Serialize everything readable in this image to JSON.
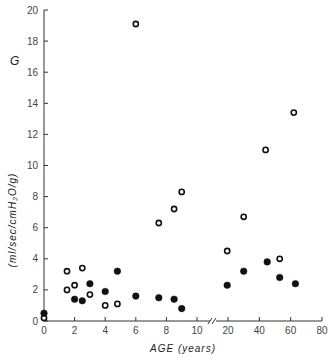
{
  "chart_data": {
    "type": "scatter",
    "title": "",
    "ylabel_symbol": "G",
    "ylabel": "(ml/sec/cmH2O/g)",
    "xlabel": "AGE (years)",
    "ylim": [
      0,
      20
    ],
    "yticks": [
      0,
      2,
      4,
      6,
      8,
      10,
      12,
      14,
      16,
      18,
      20
    ],
    "xaxis_segments": [
      {
        "range": [
          0,
          10
        ],
        "ticks": [
          0,
          2,
          4,
          6,
          8,
          10
        ]
      },
      {
        "range": [
          20,
          80
        ],
        "ticks": [
          20,
          40,
          60,
          80
        ]
      }
    ],
    "axis_break": "//",
    "grid": false,
    "legend": null,
    "series": [
      {
        "name": "open circles",
        "marker": "open-circle",
        "points": [
          {
            "x": 0,
            "y": 0.2
          },
          {
            "x": 1.5,
            "y": 3.2
          },
          {
            "x": 1.5,
            "y": 2.0
          },
          {
            "x": 2,
            "y": 2.3
          },
          {
            "x": 2.5,
            "y": 3.4
          },
          {
            "x": 3,
            "y": 1.7
          },
          {
            "x": 4,
            "y": 1.0
          },
          {
            "x": 4.8,
            "y": 1.1
          },
          {
            "x": 6,
            "y": 19.1
          },
          {
            "x": 7.5,
            "y": 6.3
          },
          {
            "x": 8.5,
            "y": 7.2
          },
          {
            "x": 9,
            "y": 8.3
          },
          {
            "x": 19.5,
            "y": 4.5
          },
          {
            "x": 30,
            "y": 6.7
          },
          {
            "x": 44,
            "y": 11.0
          },
          {
            "x": 53,
            "y": 4.0
          },
          {
            "x": 62,
            "y": 13.4
          }
        ]
      },
      {
        "name": "filled circles",
        "marker": "filled-circle",
        "points": [
          {
            "x": 0,
            "y": 0.5
          },
          {
            "x": 2,
            "y": 1.4
          },
          {
            "x": 2.5,
            "y": 1.3
          },
          {
            "x": 3,
            "y": 2.4
          },
          {
            "x": 4,
            "y": 1.9
          },
          {
            "x": 4.8,
            "y": 3.2
          },
          {
            "x": 6,
            "y": 1.6
          },
          {
            "x": 7.5,
            "y": 1.5
          },
          {
            "x": 8.5,
            "y": 1.4
          },
          {
            "x": 9,
            "y": 0.8
          },
          {
            "x": 19.5,
            "y": 2.3
          },
          {
            "x": 30,
            "y": 3.2
          },
          {
            "x": 45,
            "y": 3.8
          },
          {
            "x": 53,
            "y": 2.8
          },
          {
            "x": 63,
            "y": 2.4
          }
        ]
      }
    ]
  },
  "labels": {
    "g_symbol": "G",
    "y_axis_title": "(ml/sec/cmH₂O/g)",
    "x_axis_title": "AGE (years)",
    "x_origin_label": "0",
    "y_origin_label": "0"
  }
}
